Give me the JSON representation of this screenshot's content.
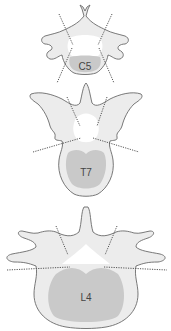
{
  "figure": {
    "colors": {
      "bone": "#ececec",
      "outline": "#6a6a6a",
      "vertebral_body": "#c9c9c9",
      "canal": "#ffffff",
      "dotted_line": "#555555",
      "label": "#444444"
    },
    "vertebrae": [
      {
        "id": "cervical",
        "label": "C5"
      },
      {
        "id": "thoracic",
        "label": "T7"
      },
      {
        "id": "lumbar",
        "label": "L4"
      }
    ]
  }
}
